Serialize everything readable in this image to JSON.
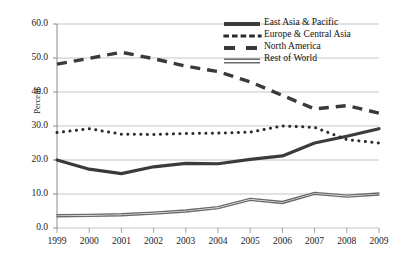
{
  "chart_data": {
    "type": "line",
    "title": "",
    "xlabel": "",
    "ylabel": "Percent",
    "x": [
      1999,
      2000,
      2001,
      2002,
      2003,
      2004,
      2005,
      2006,
      2007,
      2008,
      2009
    ],
    "categories": [
      "1999",
      "2000",
      "2001",
      "2002",
      "2003",
      "2004",
      "2005",
      "2006",
      "2007",
      "2008",
      "2009"
    ],
    "ylim": [
      0.0,
      60.0
    ],
    "yticks": [
      0.0,
      10.0,
      20.0,
      30.0,
      40.0,
      50.0,
      60.0
    ],
    "ytick_labels": [
      "0.0",
      "10.0",
      "20.0",
      "30.0",
      "40.0",
      "50.0",
      "60.0"
    ],
    "grid": true,
    "legend_position": "top-right",
    "series": [
      {
        "name": "East Asia & Pacific",
        "style": "solid",
        "color": "#3b3b3b",
        "width": 3.2,
        "values": [
          20.0,
          17.3,
          16.0,
          18.0,
          19.0,
          18.9,
          20.2,
          21.2,
          25.0,
          27.0,
          29.2
        ]
      },
      {
        "name": "Europe & Central Asia",
        "style": "dotted",
        "color": "#2b2b2b",
        "width": 2.6,
        "values": [
          28.1,
          29.2,
          27.6,
          27.5,
          27.8,
          27.9,
          28.2,
          30.0,
          29.6,
          26.0,
          25.0
        ]
      },
      {
        "name": "North America",
        "style": "dashed",
        "color": "#3a3a3a",
        "width": 3.4,
        "values": [
          48.2,
          49.9,
          51.7,
          49.8,
          47.6,
          46.0,
          43.0,
          39.0,
          35.0,
          36.0,
          33.8
        ]
      },
      {
        "name": "Rest of World",
        "style": "double",
        "color": "#6a6a6a",
        "width": 2.4,
        "values": [
          3.6,
          3.7,
          3.9,
          4.4,
          5.0,
          6.0,
          8.4,
          7.5,
          10.2,
          9.4,
          10.0
        ]
      }
    ]
  },
  "legend": {
    "items": [
      {
        "label": "East Asia & Pacific",
        "icon": "solid-line-swatch"
      },
      {
        "label": "Europe & Central Asia",
        "icon": "dotted-line-swatch"
      },
      {
        "label": "North America",
        "icon": "dashed-line-swatch"
      },
      {
        "label": "Rest of World",
        "icon": "double-line-swatch"
      }
    ]
  },
  "colors": {
    "background": "#ffffff",
    "grid": "#b6b6b6",
    "axis": "#8c8c8c",
    "text": "#1a1a1a"
  }
}
